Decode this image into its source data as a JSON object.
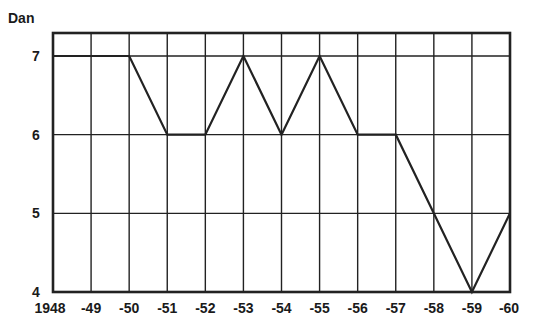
{
  "chart_data": {
    "type": "line",
    "title": "",
    "ylabel": "Dan",
    "xlabel": "",
    "categories": [
      "1948",
      "-49",
      "-50",
      "-51",
      "-52",
      "-53",
      "-54",
      "-55",
      "-56",
      "-57",
      "-58",
      "-59",
      "-60"
    ],
    "x": [
      1948,
      1949,
      1950,
      1951,
      1952,
      1953,
      1954,
      1955,
      1956,
      1957,
      1958,
      1959,
      1960
    ],
    "series": [
      {
        "name": "Dan rank",
        "values": [
          7,
          7,
          7,
          6,
          6,
          7,
          6,
          7,
          6,
          6,
          5,
          4,
          5
        ]
      }
    ],
    "yticks": [
      "4",
      "5",
      "6",
      "7"
    ],
    "ylim": [
      4,
      7.3
    ],
    "grid": true,
    "legend": "none",
    "line_color": "#222222",
    "grid_color": "#222222"
  }
}
